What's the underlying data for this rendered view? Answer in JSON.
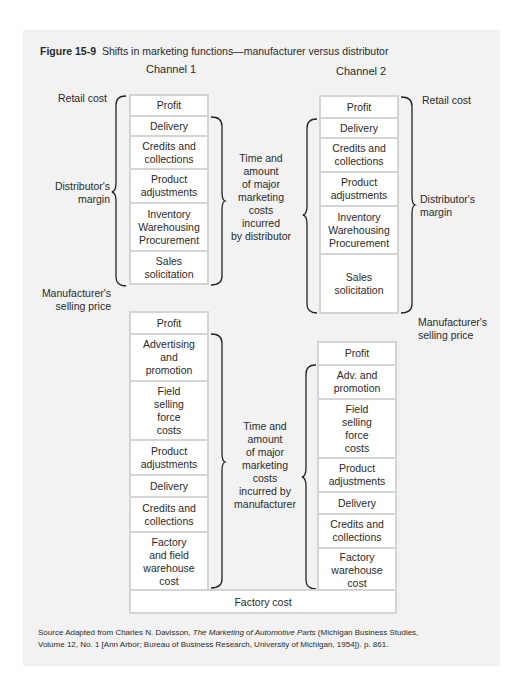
{
  "figure": {
    "label": "Figure 15-9",
    "title": "Shifts in marketing functions—manufacturer versus distributor"
  },
  "channels": {
    "channel1": {
      "heading": "Channel 1",
      "retail_cost_label": "Retail cost",
      "distributor_margin_label": [
        "Distributor's",
        "margin"
      ],
      "manufacturer_price_label": [
        "Manufacturer's",
        "selling price"
      ],
      "distributor_costs_label": [
        "Time and",
        "amount",
        "of major",
        "marketing",
        "costs",
        "incurred",
        "by distributor"
      ],
      "distributor_stack": [
        "Profit",
        "Delivery",
        "Credits and\ncollections",
        "Product\nadjustments",
        "Inventory\nWarehousing\nProcurement",
        "Sales\nsolicitation"
      ],
      "manufacturer_costs_label": [
        "Time and",
        "amount",
        "of major",
        "marketing",
        "costs",
        "incurred by",
        "manufacturer"
      ],
      "manufacturer_stack": [
        "Profit",
        "Advertising\nand\npromotion",
        "Field\nselling\nforce\ncosts",
        "Product\nadjustments",
        "Delivery",
        "Credits and\ncollections",
        "Factory\nand field\nwarehouse\ncost"
      ]
    },
    "channel2": {
      "heading": "Channel 2",
      "retail_cost_label": "Retail cost",
      "distributor_margin_label": [
        "Distributor's",
        "margin"
      ],
      "manufacturer_price_label": [
        "Manufacturer's",
        "selling price"
      ],
      "distributor_costs_label": [
        "Time and",
        "amount",
        "of major",
        "marketing",
        "costs",
        "incurred",
        "by distributor"
      ],
      "distributor_stack": [
        "Profit",
        "Delivery",
        "Credits and\ncollections",
        "Product\nadjustments",
        "Inventory\nWarehousing\nProcurement",
        "Sales\nsolicitation"
      ],
      "manufacturer_stack": [
        "Profit",
        "Adv. and\npromotion",
        "Field\nselling\nforce\ncosts",
        "Product\nadjustments",
        "Delivery",
        "Credits and\ncollections",
        "Factory\nwarehouse\ncost"
      ]
    }
  },
  "factory_cost_label": "Factory cost",
  "source": {
    "prefix": "Source  Adapted from  Charles N. Davisson, ",
    "book_title": "The Marketing of Automotive Parts",
    "suffix_line1": " (Michigan Business Studies,",
    "line2": "Volume 12, No. 1 [Ann Arbor; Bureau of Business Research, University of Michigan, 1954]). p. 861."
  }
}
